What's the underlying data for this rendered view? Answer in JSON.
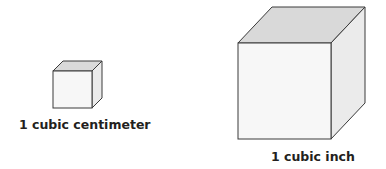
{
  "diagram": {
    "colors": {
      "background": "#ffffff",
      "front_face": "#f7f7f7",
      "top_face": "#d9d9d9",
      "side_face": "#ebebeb",
      "edge": "#3a3a3a",
      "text": "#231f20"
    },
    "cubes": [
      {
        "id": "small",
        "label": "1 cubic centimeter",
        "front": {
          "x1": 53,
          "y1": 71,
          "x2": 92,
          "y2": 108
        },
        "depth": {
          "dx": 10,
          "dy": -10
        }
      },
      {
        "id": "large",
        "label": "1 cubic inch",
        "front": {
          "x1": 238,
          "y1": 43,
          "x2": 331,
          "y2": 139
        },
        "depth": {
          "dx": 34,
          "dy": -36
        }
      }
    ]
  }
}
